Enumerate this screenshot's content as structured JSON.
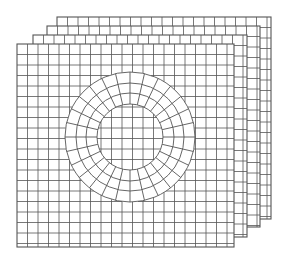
{
  "diagram": {
    "type": "stacked-mesh-sheets",
    "colors": {
      "background": "#ffffff",
      "line": "#555555",
      "sheet_fill": "#ffffff"
    },
    "sheets": [
      {
        "name": "sheet-4-back",
        "x": 57,
        "y": 17,
        "x2": 271,
        "y2": 219
      },
      {
        "name": "sheet-3",
        "x": 47,
        "y": 26,
        "x2": 260,
        "y2": 227
      },
      {
        "name": "sheet-2",
        "x": 33,
        "y": 35,
        "x2": 247,
        "y2": 237
      },
      {
        "name": "sheet-1-front",
        "x": 17,
        "y": 44,
        "x2": 234,
        "y2": 247
      }
    ],
    "grid_spacing": 10.5,
    "annulus": {
      "cx": 130,
      "cy": 137,
      "radii": [
        33,
        44,
        54,
        65
      ],
      "radial_divisions": 28
    }
  }
}
